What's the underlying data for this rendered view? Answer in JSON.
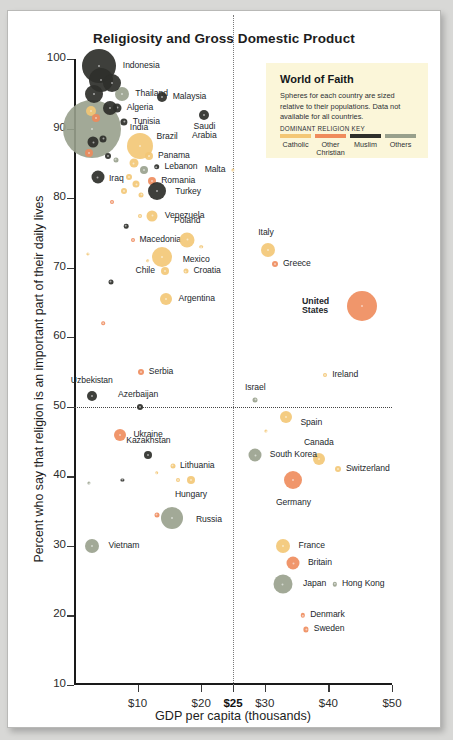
{
  "title": "Religiosity and Gross Domestic Product",
  "source": "Source: Gallup, CIA \"The World Factbook\"",
  "legend": {
    "title": "World of Faith",
    "description": "Spheres for each country are sized relative to their populations. Data not available for all countries.",
    "key_label": "DOMINANT RELIGION KEY",
    "categories": [
      {
        "name": "Catholic",
        "color": "#f3c775"
      },
      {
        "name": "Other Christian",
        "color": "#ef8b5c"
      },
      {
        "name": "Muslim",
        "color": "#2e2f2b"
      },
      {
        "name": "Others",
        "color": "#98a08c"
      }
    ]
  },
  "chart_data": {
    "type": "scatter",
    "title": "Religiosity and Gross Domestic Product",
    "xlabel": "GDP per capita (thousands)",
    "ylabel": "Percent who say that religion is an important part of their daily lives",
    "xlim": [
      0,
      50
    ],
    "ylim": [
      10,
      100
    ],
    "xticks": [
      "$10",
      "$20",
      "$25",
      "$30",
      "$40",
      "$50"
    ],
    "xtickvals": [
      10,
      20,
      25,
      30,
      40,
      50
    ],
    "yticks": [
      "10",
      "20",
      "30",
      "40",
      "50",
      "60",
      "70",
      "80",
      "90",
      "100"
    ],
    "ytickvals": [
      10,
      20,
      30,
      40,
      50,
      60,
      70,
      80,
      90,
      100
    ],
    "grid": false,
    "reference_lines": [
      {
        "axis": "y",
        "value": 50,
        "style": "dotted"
      },
      {
        "axis": "x",
        "value": 25,
        "style": "dotted"
      }
    ],
    "size_encoding": "population",
    "color_encoding": "dominant religion",
    "legend_position": "top-right",
    "points": [
      {
        "name": "Indonesia",
        "x": 3.9,
        "y": 99,
        "r": 17,
        "religion": "Muslim",
        "label": "right",
        "lx": 7,
        "ly": 0
      },
      {
        "name": "Thailand",
        "x": 7.6,
        "y": 95,
        "r": 7,
        "religion": "Others",
        "label": "right",
        "lx": 6,
        "ly": 0
      },
      {
        "name": "Malaysia",
        "x": 13.8,
        "y": 94.5,
        "r": 5,
        "religion": "Muslim",
        "label": "right",
        "lx": 6,
        "ly": 0
      },
      {
        "name": "Algeria",
        "x": 6.8,
        "y": 93,
        "r": 4.5,
        "religion": "Muslim",
        "label": "right",
        "lx": 5,
        "ly": 0
      },
      {
        "name": "Tunisia",
        "x": 7.9,
        "y": 91,
        "r": 3.6,
        "religion": "Muslim",
        "label": "right",
        "lx": 5,
        "ly": 0
      },
      {
        "name": "Saudi Arabia",
        "x": 20.5,
        "y": 92,
        "r": 5,
        "religion": "Muslim",
        "label": "below",
        "lx": 0,
        "ly": 11
      },
      {
        "name": "India",
        "x": 2.8,
        "y": 90,
        "r": 29,
        "religion": "Others",
        "label": "right",
        "lx": 9,
        "ly": -1
      },
      {
        "name": "Brazil",
        "x": 10.3,
        "y": 87.5,
        "r": 13,
        "religion": "Catholic",
        "label": "right",
        "lx": 4,
        "ly": -9
      },
      {
        "name": "Panama",
        "x": 11.8,
        "y": 86,
        "r": 4,
        "religion": "Catholic",
        "label": "right",
        "lx": 5,
        "ly": 0
      },
      {
        "name": "Lebanon",
        "x": 13.0,
        "y": 84.5,
        "r": 2.8,
        "religion": "Muslim",
        "label": "right",
        "lx": 5,
        "ly": 0
      },
      {
        "name": "Malta",
        "x": 25.0,
        "y": 84,
        "r": 1.6,
        "religion": "Catholic",
        "label": "left",
        "lx": -6,
        "ly": 0
      },
      {
        "name": "Iraq",
        "x": 3.7,
        "y": 83,
        "r": 6.5,
        "religion": "Muslim",
        "label": "right",
        "lx": 5,
        "ly": 2
      },
      {
        "name": "Romania",
        "x": 12.3,
        "y": 82.5,
        "r": 4,
        "religion": "Other Christian",
        "label": "right",
        "lx": 5,
        "ly": 0
      },
      {
        "name": "Turkey",
        "x": 13.1,
        "y": 81,
        "r": 9,
        "religion": "Muslim",
        "label": "right",
        "lx": 9,
        "ly": 1
      },
      {
        "name": "Venezuela",
        "x": 12.3,
        "y": 77.5,
        "r": 5.5,
        "religion": "Catholic",
        "label": "right",
        "lx": 7,
        "ly": 0
      },
      {
        "name": "Macedonia",
        "x": 9.2,
        "y": 74,
        "r": 2,
        "religion": "Other Christian",
        "label": "right",
        "lx": 5,
        "ly": 0
      },
      {
        "name": "Poland",
        "x": 17.8,
        "y": 74,
        "r": 7.5,
        "religion": "Catholic",
        "label": "above",
        "lx": 0,
        "ly": -11
      },
      {
        "name": "Mexico",
        "x": 13.8,
        "y": 71.5,
        "r": 10,
        "religion": "Catholic",
        "label": "right",
        "lx": 11,
        "ly": 3
      },
      {
        "name": "Chile",
        "x": 14.3,
        "y": 69.5,
        "r": 4,
        "religion": "Catholic",
        "label": "left",
        "lx": -6,
        "ly": 0
      },
      {
        "name": "Croatia",
        "x": 17.6,
        "y": 69.5,
        "r": 2.5,
        "religion": "Catholic",
        "label": "right",
        "lx": 5,
        "ly": 0
      },
      {
        "name": "Argentina",
        "x": 14.4,
        "y": 65.5,
        "r": 6,
        "religion": "Catholic",
        "label": "right",
        "lx": 7,
        "ly": 0
      },
      {
        "name": "Italy",
        "x": 30.5,
        "y": 72.5,
        "r": 7,
        "religion": "Catholic",
        "label": "above",
        "lx": -2,
        "ly": -10
      },
      {
        "name": "Greece",
        "x": 31.6,
        "y": 70.5,
        "r": 3,
        "religion": "Other Christian",
        "label": "right",
        "lx": 5,
        "ly": 0
      },
      {
        "name": "United States",
        "x": 45.3,
        "y": 64.5,
        "r": 15,
        "religion": "Other Christian",
        "label": "left",
        "lx": -18,
        "ly": 0
      },
      {
        "name": "Serbia",
        "x": 10.5,
        "y": 55,
        "r": 3,
        "religion": "Other Christian",
        "label": "right",
        "lx": 5,
        "ly": 0
      },
      {
        "name": "Ireland",
        "x": 39.5,
        "y": 54.5,
        "r": 2,
        "religion": "Catholic",
        "label": "right",
        "lx": 5,
        "ly": 0
      },
      {
        "name": "Israel",
        "x": 28.5,
        "y": 51,
        "r": 2.5,
        "religion": "Others",
        "label": "above",
        "lx": 0,
        "ly": -9
      },
      {
        "name": "Uzbekistan",
        "x": 2.8,
        "y": 51.5,
        "r": 5,
        "religion": "Muslim",
        "label": "above",
        "lx": 0,
        "ly": -10
      },
      {
        "name": "Azerbaijan",
        "x": 10.4,
        "y": 50,
        "r": 3,
        "religion": "Muslim",
        "label": "above",
        "lx": -2,
        "ly": -9
      },
      {
        "name": "Spain",
        "x": 33.4,
        "y": 48.5,
        "r": 6,
        "religion": "Catholic",
        "label": "right",
        "lx": 8,
        "ly": 6
      },
      {
        "name": "Ukraine",
        "x": 7.3,
        "y": 46,
        "r": 6,
        "religion": "Other Christian",
        "label": "right",
        "lx": 7,
        "ly": 0
      },
      {
        "name": "Canada",
        "x": 38.5,
        "y": 42.5,
        "r": 6,
        "religion": "Catholic",
        "label": "above",
        "lx": 0,
        "ly": -10
      },
      {
        "name": "South Korea",
        "x": 28.5,
        "y": 43,
        "r": 6.5,
        "religion": "Others",
        "label": "right",
        "lx": 8,
        "ly": 0
      },
      {
        "name": "Kazakhstan",
        "x": 11.7,
        "y": 43,
        "r": 4,
        "religion": "Muslim",
        "label": "above",
        "lx": 0,
        "ly": -10
      },
      {
        "name": "Lithuania",
        "x": 15.5,
        "y": 41.5,
        "r": 2.5,
        "religion": "Catholic",
        "label": "right",
        "lx": 5,
        "ly": 0
      },
      {
        "name": "Switzerland",
        "x": 41.5,
        "y": 41,
        "r": 3,
        "religion": "Catholic",
        "label": "right",
        "lx": 5,
        "ly": 0
      },
      {
        "name": "Germany",
        "x": 34.5,
        "y": 39.5,
        "r": 9,
        "religion": "Other Christian",
        "label": "below",
        "lx": 0,
        "ly": 14
      },
      {
        "name": "Hungary",
        "x": 18.4,
        "y": 39.5,
        "r": 4,
        "religion": "Catholic",
        "label": "below",
        "lx": 0,
        "ly": 11
      },
      {
        "name": "Russia",
        "x": 15.4,
        "y": 34,
        "r": 11,
        "religion": "Others",
        "label": "right",
        "lx": 13,
        "ly": 2
      },
      {
        "name": "Vietnam",
        "x": 2.9,
        "y": 30,
        "r": 7,
        "religion": "Others",
        "label": "right",
        "lx": 9,
        "ly": 0
      },
      {
        "name": "France",
        "x": 32.8,
        "y": 30,
        "r": 7,
        "religion": "Catholic",
        "label": "right",
        "lx": 9,
        "ly": 0
      },
      {
        "name": "Britain",
        "x": 34.5,
        "y": 27.5,
        "r": 6.5,
        "religion": "Other Christian",
        "label": "right",
        "lx": 8,
        "ly": 0
      },
      {
        "name": "Japan",
        "x": 32.8,
        "y": 24.5,
        "r": 9.5,
        "religion": "Others",
        "label": "right",
        "lx": 11,
        "ly": 0
      },
      {
        "name": "Hong Kong",
        "x": 41.0,
        "y": 24.5,
        "r": 2.2,
        "religion": "Others",
        "label": "right",
        "lx": 5,
        "ly": 0
      },
      {
        "name": "Denmark",
        "x": 36.0,
        "y": 20,
        "r": 2.2,
        "religion": "Other Christian",
        "label": "right",
        "lx": 5,
        "ly": 0
      },
      {
        "name": "Sweden",
        "x": 36.5,
        "y": 18,
        "r": 2.6,
        "religion": "Other Christian",
        "label": "right",
        "lx": 5,
        "ly": 0
      },
      {
        "name": "",
        "x": 4.2,
        "y": 97,
        "r": 12,
        "religion": "Muslim"
      },
      {
        "name": "",
        "x": 6.0,
        "y": 96.5,
        "r": 9,
        "religion": "Muslim"
      },
      {
        "name": "",
        "x": 3.2,
        "y": 95,
        "r": 9,
        "religion": "Muslim"
      },
      {
        "name": "",
        "x": 5.6,
        "y": 93,
        "r": 7,
        "religion": "Muslim"
      },
      {
        "name": "",
        "x": 2.6,
        "y": 92.5,
        "r": 5,
        "religion": "Catholic"
      },
      {
        "name": "",
        "x": 3.4,
        "y": 91.5,
        "r": 4,
        "religion": "Other Christian"
      },
      {
        "name": "",
        "x": 3.0,
        "y": 88,
        "r": 5.5,
        "religion": "Muslim"
      },
      {
        "name": "",
        "x": 4.6,
        "y": 88.5,
        "r": 3.5,
        "religion": "Muslim"
      },
      {
        "name": "",
        "x": 2.4,
        "y": 86.5,
        "r": 4,
        "religion": "Other Christian"
      },
      {
        "name": "",
        "x": 5.4,
        "y": 86,
        "r": 3,
        "religion": "Muslim"
      },
      {
        "name": "",
        "x": 6.6,
        "y": 85.5,
        "r": 2.5,
        "religion": "Others"
      },
      {
        "name": "",
        "x": 9.4,
        "y": 85,
        "r": 4.5,
        "religion": "Catholic"
      },
      {
        "name": "",
        "x": 11.0,
        "y": 84,
        "r": 4,
        "religion": "Others"
      },
      {
        "name": "",
        "x": 8.6,
        "y": 83,
        "r": 3,
        "religion": "Catholic"
      },
      {
        "name": "",
        "x": 9.8,
        "y": 82,
        "r": 3.5,
        "religion": "Catholic"
      },
      {
        "name": "",
        "x": 7.8,
        "y": 81,
        "r": 3,
        "religion": "Catholic"
      },
      {
        "name": "",
        "x": 10.6,
        "y": 80.5,
        "r": 2.5,
        "religion": "Catholic"
      },
      {
        "name": "",
        "x": 6.0,
        "y": 79.5,
        "r": 2,
        "religion": "Other Christian"
      },
      {
        "name": "",
        "x": 10.4,
        "y": 77.5,
        "r": 2,
        "religion": "Catholic"
      },
      {
        "name": "",
        "x": 8.2,
        "y": 76,
        "r": 2.3,
        "religion": "Muslim"
      },
      {
        "name": "",
        "x": 20.0,
        "y": 73,
        "r": 1.8,
        "religion": "Catholic"
      },
      {
        "name": "",
        "x": 11.6,
        "y": 71,
        "r": 1.8,
        "religion": "Catholic"
      },
      {
        "name": "",
        "x": 5.8,
        "y": 68,
        "r": 2.5,
        "religion": "Muslim"
      },
      {
        "name": "",
        "x": 4.6,
        "y": 62,
        "r": 1.8,
        "religion": "Other Christian"
      },
      {
        "name": "",
        "x": 2.2,
        "y": 72,
        "r": 1.6,
        "religion": "Catholic"
      },
      {
        "name": "",
        "x": 30.2,
        "y": 46.5,
        "r": 1.6,
        "religion": "Catholic"
      },
      {
        "name": "",
        "x": 13.0,
        "y": 40.5,
        "r": 1.8,
        "religion": "Catholic"
      },
      {
        "name": "",
        "x": 16.3,
        "y": 39.5,
        "r": 2,
        "religion": "Catholic"
      },
      {
        "name": "",
        "x": 7.6,
        "y": 39.5,
        "r": 1.6,
        "religion": "Muslim"
      },
      {
        "name": "",
        "x": 2.4,
        "y": 39,
        "r": 1.6,
        "religion": "Others"
      },
      {
        "name": "",
        "x": 13.0,
        "y": 34.5,
        "r": 2.5,
        "religion": "Other Christian"
      }
    ]
  }
}
